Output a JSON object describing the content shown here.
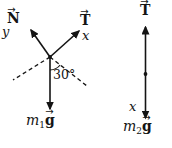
{
  "colors": {
    "ink": "#141414",
    "background": "#ffffff"
  },
  "notation": {
    "vector_arrow": "→"
  },
  "left_diagram": {
    "description": "free-body diagram of mass m1 on 30 degree incline",
    "normal_label": "N",
    "y_axis_label": "y",
    "tension_label": "T",
    "x_axis_label": "x",
    "angle_label": "30°",
    "weight_mass_symbol": "m",
    "weight_mass_subscript": "1",
    "weight_g_symbol": "g"
  },
  "right_diagram": {
    "description": "free-body diagram of hanging mass m2",
    "tension_label": "T",
    "x_axis_label": "x",
    "weight_mass_symbol": "m",
    "weight_mass_subscript": "2",
    "weight_g_symbol": "g"
  }
}
